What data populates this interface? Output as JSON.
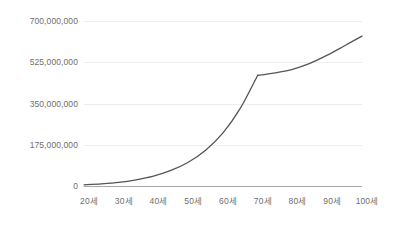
{
  "chart_data": {
    "type": "line",
    "title": "",
    "subtitle": "",
    "xlabel": "",
    "ylabel": "",
    "legend": [],
    "legend_position": "none",
    "grid": true,
    "background_color": "#ffffff",
    "line_color": "#555555",
    "gridline_color": "#ededed",
    "axis_color": "#a8a8a8",
    "label_color": "#6e6e6e",
    "xlim": [
      20,
      100
    ],
    "ylim": [
      0,
      700000000
    ],
    "y_ticks": [
      0,
      175000000,
      350000000,
      525000000,
      700000000
    ],
    "y_tick_labels": [
      "0",
      "175,000,000",
      "350,000,000",
      "525,000,000",
      "700,000,000"
    ],
    "x_ticks": [
      20,
      30,
      40,
      50,
      60,
      70,
      80,
      90,
      100
    ],
    "x_tick_labels": [
      "20세",
      "30세",
      "40세",
      "50세",
      "60세",
      "70세",
      "80세",
      "90세",
      "100세"
    ],
    "series": [
      {
        "name": "accumulated-amount",
        "x": [
          20,
          25,
          30,
          35,
          40,
          45,
          50,
          55,
          60,
          65,
          70,
          70.5,
          75,
          80,
          85,
          90,
          95,
          100
        ],
        "values": [
          5000000,
          9000000,
          15000000,
          26000000,
          42000000,
          66000000,
          101000000,
          152000000,
          225000000,
          330000000,
          470000000,
          470000000,
          480000000,
          495000000,
          520000000,
          555000000,
          595000000,
          636000000
        ]
      }
    ]
  }
}
